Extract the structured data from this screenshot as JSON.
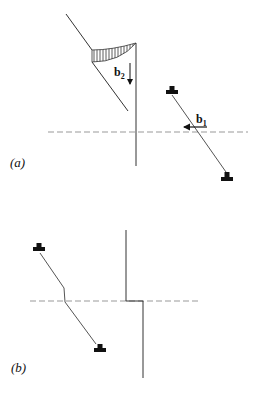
{
  "figure": {
    "panel_a": {
      "label": "(a)",
      "vector_b2": {
        "symbol": "b",
        "subscript": "2"
      },
      "vector_b1": {
        "symbol": "b",
        "subscript": "1"
      },
      "dislocations": [
        "edge-dislocation-upper",
        "edge-dislocation-lower"
      ]
    },
    "panel_b": {
      "label": "(b)",
      "dislocations": [
        "edge-dislocation-upper",
        "edge-dislocation-lower"
      ]
    }
  },
  "colors": {
    "line": "#333333",
    "dashed": "#999999",
    "symbol": "#111111"
  }
}
